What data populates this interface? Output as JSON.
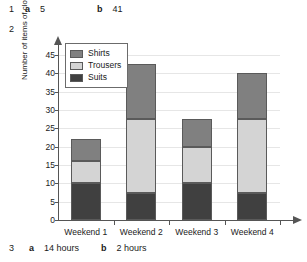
{
  "answers": [
    {
      "number": "1",
      "parts": [
        {
          "label": "a",
          "value": "5"
        },
        {
          "label": "b",
          "value": "41"
        }
      ]
    },
    {
      "number": "2",
      "parts": []
    },
    {
      "number": "3",
      "parts": [
        {
          "label": "a",
          "value": "14 hours"
        },
        {
          "label": "b",
          "value": "2 hours"
        }
      ]
    }
  ],
  "chart_data": {
    "type": "bar",
    "subtype": "stacked",
    "title": "",
    "xlabel": "",
    "ylabel": "Number of items of clothing",
    "categories": [
      "Weekend 1",
      "Weekend 2",
      "Weekend 3",
      "Weekend 4"
    ],
    "ylim": [
      0,
      45
    ],
    "yticks": [
      0,
      5,
      10,
      15,
      20,
      25,
      30,
      35,
      40,
      45
    ],
    "ytick_labels": [
      "0",
      "5",
      "10",
      "15",
      "20",
      "25",
      "30",
      "35",
      "40",
      "45"
    ],
    "grid": true,
    "legend_position": "top-left",
    "series": [
      {
        "name": "Suits",
        "color": "#404040",
        "values": [
          10,
          7.5,
          10,
          7.5
        ]
      },
      {
        "name": "Trousers",
        "color": "#d4d4d4",
        "values": [
          6,
          20,
          10,
          20
        ]
      },
      {
        "name": "Shirts",
        "color": "#808080",
        "values": [
          6,
          15,
          7.5,
          12.5
        ]
      }
    ],
    "totals": [
      22,
      42.5,
      27.5,
      40
    ],
    "legend_order": [
      "Shirts",
      "Trousers",
      "Suits"
    ]
  },
  "colors": {
    "shirts": "#808080",
    "trousers": "#d4d4d4",
    "suits": "#404040",
    "axis": "#555555",
    "grid": "#e6e6e6"
  }
}
